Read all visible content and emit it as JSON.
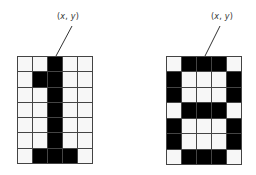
{
  "figure": {
    "glyphs": [
      {
        "name": "digit-1",
        "label": {
          "open": "(",
          "x": "x",
          "sep": ", ",
          "y": "y",
          "close": ")"
        },
        "cols": 5,
        "rows": 7,
        "bitmap": [
          "00100",
          "01100",
          "00100",
          "00100",
          "00100",
          "00100",
          "01110"
        ],
        "box": {
          "left": 17,
          "top": 56,
          "width": 76,
          "height": 108
        },
        "label_pos": {
          "x": 68,
          "y": 12
        },
        "leader": {
          "x1": 72,
          "y1": 26,
          "x2": 56,
          "y2": 56
        }
      },
      {
        "name": "digit-8",
        "label": {
          "open": "(",
          "x": "x",
          "sep": ", ",
          "y": "y",
          "close": ")"
        },
        "cols": 5,
        "rows": 7,
        "bitmap": [
          "01110",
          "10001",
          "10001",
          "01110",
          "10001",
          "10001",
          "01110"
        ],
        "box": {
          "left": 166,
          "top": 56,
          "width": 76,
          "height": 109
        },
        "label_pos": {
          "x": 222,
          "y": 12
        },
        "leader": {
          "x1": 220,
          "y1": 26,
          "x2": 205,
          "y2": 56
        }
      }
    ],
    "colors": {
      "on": "#000000",
      "off": "#f7f7f7",
      "gridline": "#444444",
      "leader": "#333333"
    }
  }
}
